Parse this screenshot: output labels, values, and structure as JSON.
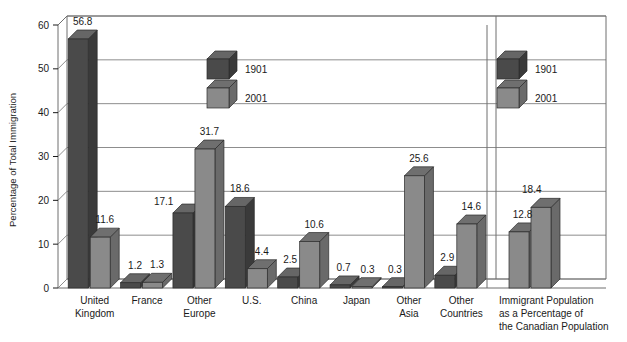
{
  "chart_data": {
    "type": "bar",
    "title": "",
    "subtitle": "",
    "xlabel": "",
    "ylabel": "Percentage of Total Immigration",
    "ylim": [
      0,
      60
    ],
    "yticks": [
      0,
      10,
      20,
      30,
      40,
      50,
      60
    ],
    "ytick_labels": [
      "0",
      "10",
      "20",
      "30",
      "40",
      "50",
      "60"
    ],
    "grid": true,
    "grid_axis": "y",
    "legend": {
      "position": "inside-top-center, repeated inside-right-panel",
      "entries": [
        {
          "name": "1901",
          "color": "#4a4a4a"
        },
        {
          "name": "2001",
          "color": "#8a8a8a"
        }
      ]
    },
    "categories": [
      "United Kingdom",
      "France",
      "Other Europe",
      "U.S.",
      "China",
      "Japan",
      "Other Asia",
      "Other Countries",
      "Immigrant Population as a Percentage of the Canadian Population"
    ],
    "category_label_lines": [
      [
        "United",
        "Kingdom"
      ],
      [
        "France"
      ],
      [
        "Other",
        "Europe"
      ],
      [
        "U.S."
      ],
      [
        "China"
      ],
      [
        "Japan"
      ],
      [
        "Other",
        "Asia"
      ],
      [
        "Other",
        "Countries"
      ],
      [
        "Immigrant Population",
        "as a Percentage of",
        "the Canadian Population"
      ]
    ],
    "series": [
      {
        "name": "1901",
        "color": "#4a4a4a",
        "values": [
          56.8,
          1.2,
          17.1,
          18.6,
          2.5,
          0.7,
          0.3,
          2.9,
          12.8
        ],
        "labels": [
          "56.8",
          "1.2",
          "17.1",
          "18.6",
          "2.5",
          "0.7",
          "0.3",
          "2.9",
          "12.8"
        ]
      },
      {
        "name": "2001",
        "color": "#8a8a8a",
        "values": [
          11.6,
          1.3,
          31.7,
          4.4,
          10.6,
          0.3,
          25.6,
          14.6,
          18.4
        ],
        "labels": [
          "11.6",
          "1.3",
          "31.7",
          "4.4",
          "10.6",
          "0.3",
          "25.6",
          "14.6",
          "18.4"
        ]
      }
    ],
    "panels": [
      {
        "name": "immigration-by-origin-panel",
        "categories": 8
      },
      {
        "name": "immigrant-population-share-panel",
        "categories": 1
      }
    ],
    "colors": {
      "series_1901": "#4a4a4a",
      "series_2001": "#8a8a8a",
      "series_1901_top": "#666666",
      "series_1901_side": "#3a3a3a",
      "series_2001_top": "#6f6f6f",
      "series_2001_side": "#6a6a6a",
      "grid": "#808080",
      "frame": "#6e6e6e",
      "background": "#ffffff",
      "text": "#1a1a1a"
    }
  },
  "axis": {
    "y_title": "Percentage of Total Immigration"
  }
}
